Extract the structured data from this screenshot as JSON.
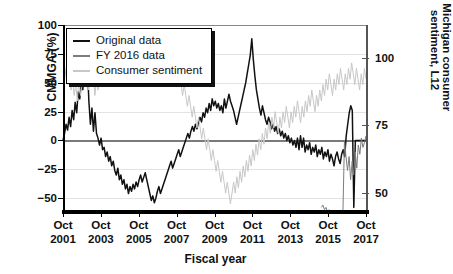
{
  "chart_data": {
    "type": "line",
    "title": "",
    "xlabel": "Fiscal year",
    "ylabel": "CMMGA (%)",
    "y2label": "U. Michigan consumer sentiment, L12",
    "xlim": [
      "Oct 2001",
      "Oct 2017"
    ],
    "ylim": [
      -62,
      100
    ],
    "y2lim": [
      112,
      43
    ],
    "y2_inverted": true,
    "grid": "horizontal",
    "legend_position": "top-left",
    "yticks": [
      100,
      75,
      50,
      25,
      0,
      -25,
      -50
    ],
    "ytick_labels": [
      "100",
      "75",
      "50",
      "25",
      "0",
      "−25",
      "−50"
    ],
    "y2ticks": [
      50,
      75,
      100
    ],
    "y2tick_labels": [
      "50",
      "75",
      "100"
    ],
    "xticks": [
      "Oct 2001",
      "Oct 2003",
      "Oct 2005",
      "Oct 2007",
      "Oct 2009",
      "Oct 2011",
      "Oct 2013",
      "Oct 2015",
      "Oct 2017"
    ],
    "xtick_lines": [
      [
        "Oct",
        "2001"
      ],
      [
        "Oct",
        "2003"
      ],
      [
        "Oct",
        "2005"
      ],
      [
        "Oct",
        "2007"
      ],
      [
        "Oct",
        "2009"
      ],
      [
        "Oct",
        "2011"
      ],
      [
        "Oct",
        "2013"
      ],
      [
        "Oct",
        "2015"
      ],
      [
        "Oct",
        "2017"
      ]
    ],
    "colors": {
      "original": "#111111",
      "fy2016": "#7d7d7d",
      "sentiment": "#c7c7c7"
    },
    "series": [
      {
        "name": "Original data",
        "color": "#111111",
        "axis": "left",
        "units": "CMMGA (%)",
        "values": [
          0,
          6,
          14,
          9,
          20,
          12,
          26,
          18,
          33,
          24,
          42,
          36,
          50,
          44,
          58,
          52,
          66,
          34,
          14,
          28,
          8,
          24,
          6,
          2,
          -4,
          2,
          -8,
          -6,
          -14,
          -10,
          -18,
          -14,
          -22,
          -18,
          -26,
          -30,
          -24,
          -34,
          -30,
          -38,
          -34,
          -42,
          -38,
          -46,
          -40,
          -44,
          -38,
          -42,
          -36,
          -40,
          -34,
          -30,
          -36,
          -32,
          -28,
          -34,
          -40,
          -46,
          -52,
          -48,
          -54,
          -50,
          -44,
          -40,
          -46,
          -42,
          -38,
          -34,
          -30,
          -26,
          -22,
          -18,
          -24,
          -20,
          -16,
          -12,
          -8,
          -14,
          -10,
          -6,
          -2,
          2,
          6,
          2,
          8,
          12,
          8,
          14,
          10,
          16,
          20,
          16,
          24,
          20,
          28,
          24,
          32,
          26,
          36,
          30,
          34,
          28,
          32,
          26,
          30,
          24,
          36,
          28,
          34,
          40,
          34,
          30,
          26,
          20,
          14,
          20,
          26,
          32,
          38,
          44,
          50,
          58,
          66,
          74,
          88,
          70,
          56,
          44,
          36,
          28,
          22,
          30,
          24,
          18,
          14,
          20,
          16,
          10,
          14,
          8,
          12,
          6,
          10,
          4,
          8,
          2,
          6,
          0,
          4,
          -2,
          2,
          -4,
          0,
          -6,
          2,
          -8,
          4,
          -6,
          2,
          -10,
          -4,
          -8,
          -2,
          -12,
          -6,
          -10,
          -4,
          -14,
          -8,
          -12,
          -6,
          -16,
          -10,
          -14,
          -8,
          -18,
          -12,
          -16,
          -22,
          -14,
          -10,
          -16,
          -20,
          -12,
          -8,
          -14,
          4,
          14,
          24,
          30,
          26,
          -58,
          0,
          0,
          0,
          0,
          0,
          0,
          0,
          0
        ]
      },
      {
        "name": "FY 2016 data",
        "color": "#7d7d7d",
        "axis": "left",
        "units": "CMMGA (%)",
        "values": [
          0,
          4,
          -4,
          2,
          -8,
          6,
          -2,
          10,
          4,
          14,
          8,
          18,
          10,
          20,
          12,
          22,
          14,
          6,
          -2,
          4,
          -6,
          2,
          -10,
          -4,
          -14,
          -8,
          -16,
          -10,
          -18,
          -12,
          -20,
          -14,
          -22,
          -16,
          -24,
          -18,
          -26,
          -20,
          -28,
          -22,
          -30,
          -24,
          -28,
          -22,
          -26,
          -20,
          -24,
          -18,
          -22,
          -16,
          -20,
          -14,
          -18,
          -12,
          -16,
          -10,
          -14,
          -8,
          -12,
          -6,
          -10,
          -4,
          -8,
          -2,
          -6,
          0,
          -4,
          2,
          -2,
          4,
          0,
          6,
          2,
          8,
          4,
          10,
          6,
          12,
          8,
          14,
          10,
          16,
          12,
          18,
          14,
          20,
          16,
          22,
          18,
          24,
          20,
          22,
          18,
          20,
          16,
          18,
          14,
          16,
          12,
          14,
          10,
          12,
          8,
          10,
          6,
          8,
          4,
          6,
          2,
          4,
          0,
          2,
          -2,
          0,
          -4,
          -2,
          -6,
          -4,
          -8,
          -6,
          -10,
          -8,
          -12,
          -10,
          -14,
          -12,
          -16,
          -14,
          -18,
          -16,
          -20,
          -18,
          -22,
          -20,
          -24,
          -22,
          -26,
          -24,
          -28,
          -26,
          -30,
          -28,
          -32,
          -30,
          -34,
          -32,
          -36,
          -34,
          -38,
          -36,
          -40,
          -38,
          -42,
          -40,
          -44,
          -42,
          -46,
          -44,
          -48,
          -46,
          -50,
          -48,
          -52,
          -50,
          -54,
          -52,
          -56,
          -54,
          -58,
          -56,
          -60,
          -58,
          -62,
          -60,
          -64,
          -62,
          -66,
          -64,
          -68,
          -66,
          -70,
          -68,
          -72,
          0,
          -14,
          -26,
          -14,
          -34,
          -18,
          -30,
          -10,
          -24,
          -4,
          -12,
          2,
          -6,
          -2,
          4
        ],
        "visible_from_fraction": 0.855
      },
      {
        "name": "Consumer sentiment",
        "color": "#c7c7c7",
        "axis": "right",
        "units": "U. Michigan consumer sentiment, L12",
        "values": [
          95,
          92,
          96,
          90,
          94,
          88,
          92,
          86,
          90,
          84,
          92,
          86,
          90,
          96,
          90,
          94,
          88,
          96,
          90,
          94,
          86,
          92,
          88,
          94,
          90,
          96,
          92,
          98,
          94,
          100,
          96,
          102,
          98,
          96,
          100,
          96,
          98,
          94,
          96,
          92,
          94,
          90,
          96,
          92,
          98,
          94,
          100,
          96,
          102,
          98,
          104,
          100,
          98,
          102,
          98,
          104,
          100,
          106,
          102,
          108,
          104,
          110,
          106,
          108,
          104,
          102,
          100,
          104,
          100,
          96,
          98,
          94,
          90,
          94,
          90,
          86,
          90,
          86,
          82,
          86,
          82,
          78,
          82,
          78,
          74,
          78,
          74,
          70,
          74,
          70,
          66,
          70,
          66,
          62,
          66,
          62,
          58,
          62,
          58,
          54,
          58,
          54,
          50,
          54,
          50,
          46,
          50,
          54,
          50,
          56,
          52,
          58,
          54,
          60,
          56,
          62,
          58,
          64,
          60,
          66,
          62,
          68,
          64,
          70,
          66,
          72,
          68,
          74,
          70,
          76,
          72,
          78,
          74,
          80,
          76,
          72,
          78,
          74,
          80,
          76,
          82,
          78,
          74,
          80,
          76,
          82,
          78,
          84,
          80,
          76,
          82,
          78,
          84,
          80,
          86,
          82,
          88,
          84,
          80,
          86,
          82,
          88,
          84,
          90,
          86,
          92,
          88,
          94,
          90,
          86,
          92,
          88,
          94,
          90,
          96,
          92,
          88,
          94,
          90,
          96,
          92,
          98,
          94,
          90,
          96,
          92,
          88,
          94,
          90,
          96,
          92
        ]
      }
    ]
  },
  "legend": {
    "items": [
      {
        "label": "Original data",
        "color": "#111111"
      },
      {
        "label": "FY 2016 data",
        "color": "#7d7d7d"
      },
      {
        "label": "Consumer sentiment",
        "color": "#c7c7c7"
      }
    ]
  }
}
